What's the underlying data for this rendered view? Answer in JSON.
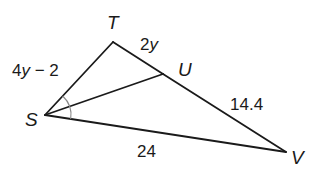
{
  "diagram": {
    "type": "triangle-angle-bisector",
    "vertices": {
      "T": {
        "label": "T",
        "x": 113,
        "y": 42
      },
      "U": {
        "label": "U",
        "x": 163,
        "y": 74
      },
      "S": {
        "label": "S",
        "x": 45,
        "y": 115
      },
      "V": {
        "label": "V",
        "x": 286,
        "y": 152
      }
    },
    "segments": [
      {
        "from": "S",
        "to": "T",
        "label": "4y − 2"
      },
      {
        "from": "T",
        "to": "U",
        "label": "2y"
      },
      {
        "from": "U",
        "to": "V",
        "label": "14.4"
      },
      {
        "from": "S",
        "to": "V",
        "label": "24"
      },
      {
        "from": "S",
        "to": "U",
        "label": ""
      }
    ],
    "labels": {
      "ST": "4y − 2",
      "TU_coef": "2",
      "TU_var": "y",
      "ST_coef": "4",
      "ST_var": "y",
      "ST_rest": " − 2",
      "UV": "14.4",
      "SV": "24"
    },
    "angle_marks": [
      {
        "vertex": "S",
        "description": "bisected angle TSV",
        "color": "#8a8a8a"
      }
    ],
    "colors": {
      "line": "#1a1a1a",
      "angle_arc": "#8a8a8a",
      "background": "#ffffff"
    }
  }
}
